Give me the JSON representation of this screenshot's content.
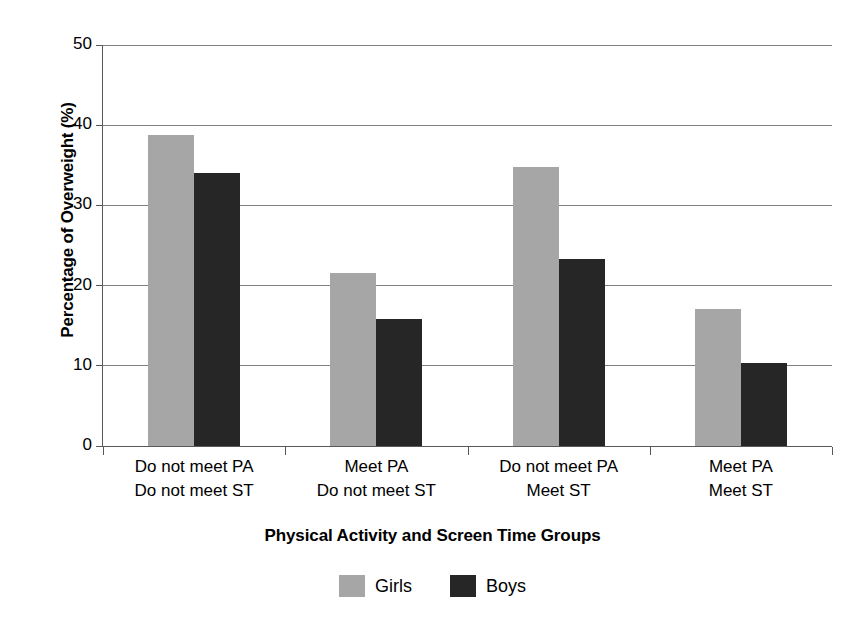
{
  "chart_data": {
    "type": "bar",
    "title": "",
    "xlabel": "Physical Activity and Screen Time Groups",
    "ylabel": "Percentage of Overweight (%)",
    "categories": [
      "Do not meet PA\nDo not meet ST",
      "Meet PA\nDo not meet ST",
      "Do not meet PA\nMeet ST",
      "Meet PA\nMeet ST"
    ],
    "category_lines": [
      [
        "Do not meet PA",
        "Do not meet ST"
      ],
      [
        "Meet PA",
        "Do not meet ST"
      ],
      [
        "Do not meet PA",
        "Meet ST"
      ],
      [
        "Meet PA",
        "Meet ST"
      ]
    ],
    "series": [
      {
        "name": "Girls",
        "color": "#a6a6a6",
        "values": [
          38.8,
          21.6,
          34.8,
          17.1
        ]
      },
      {
        "name": "Boys",
        "color": "#262626",
        "values": [
          34.1,
          15.8,
          23.3,
          10.3
        ]
      }
    ],
    "ylim": [
      0,
      50
    ],
    "yticks": [
      0,
      10,
      20,
      30,
      40,
      50
    ],
    "ytick_labels": [
      "0",
      "10",
      "20",
      "30",
      "40",
      "50"
    ],
    "grid": true,
    "grid_axis": "y",
    "legend_position": "bottom",
    "legend_entries": [
      "Girls",
      "Boys"
    ]
  },
  "axes": {
    "y_title": "Percentage of Overweight (%)",
    "x_title": "Physical Activity and Screen Time Groups"
  },
  "legend": {
    "items": [
      {
        "label": "Girls",
        "swatch": "girls-swatch"
      },
      {
        "label": "Boys",
        "swatch": "boys-swatch"
      }
    ]
  }
}
